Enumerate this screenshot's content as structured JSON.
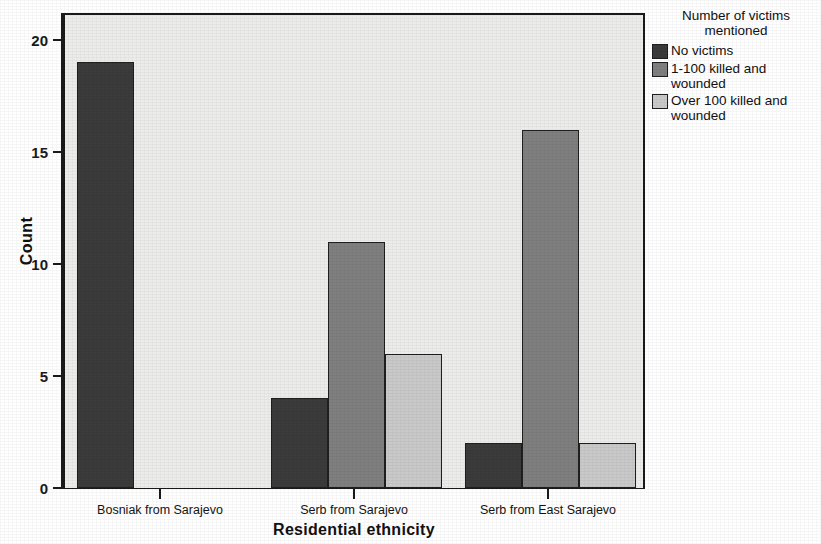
{
  "chart_data": {
    "type": "bar",
    "title": "",
    "xlabel": "Residential ethnicity",
    "ylabel": "Count",
    "categories": [
      "Bosniak from Sarajevo",
      "Serb from Sarajevo",
      "Serb from East Sarajevo"
    ],
    "series": [
      {
        "name": "No victims",
        "values": [
          19,
          4,
          2
        ],
        "color": "#3b3b3b"
      },
      {
        "name": "1-100 killed and wounded",
        "values": [
          0,
          11,
          16
        ],
        "color": "#7f7f7f"
      },
      {
        "name": "Over 100 killed and wounded",
        "values": [
          0,
          6,
          2
        ],
        "color": "#c9c9c9"
      }
    ],
    "ylim": [
      0,
      21.2
    ],
    "yticks": [
      0,
      5,
      10,
      15,
      20
    ],
    "ytick_labels": [
      "0",
      "5",
      "10",
      "15",
      "20"
    ],
    "grid": false,
    "legend_position": "right",
    "plot_background": "#ececeb"
  },
  "legend": {
    "title_line1": "Number of victims",
    "title_line2": "mentioned",
    "entries": [
      {
        "label": "No victims",
        "color": "#3b3b3b"
      },
      {
        "label": "1-100 killed and",
        "label2": "wounded",
        "color": "#7f7f7f"
      },
      {
        "label": "Over 100 killed and",
        "label2": "wounded",
        "color": "#c9c9c9"
      }
    ]
  }
}
